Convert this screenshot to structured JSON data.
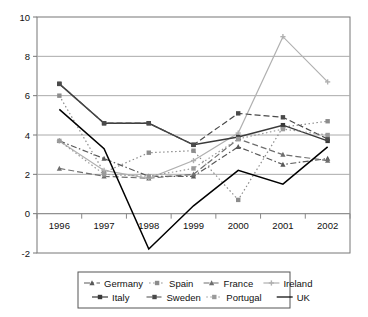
{
  "chart_data": {
    "type": "line",
    "title": "",
    "subtitle": "",
    "xlabel": "",
    "ylabel": "",
    "x": [
      1996,
      1997,
      1998,
      1999,
      2000,
      2001,
      2002
    ],
    "xtick_labels": [
      "1996",
      "1997",
      "1998",
      "1999",
      "2000",
      "2001",
      "2002"
    ],
    "ytick_labels": [
      "10",
      "8",
      "6",
      "4",
      "2",
      "0",
      "-2"
    ],
    "ylim": [
      -2,
      10
    ],
    "ytick_values": [
      10,
      8,
      6,
      4,
      2,
      0,
      -2
    ],
    "grid": "horizontal",
    "legend_position": "bottom",
    "series": [
      {
        "name": "Germany",
        "color": "#585858",
        "line_style": "dashdot",
        "marker": "triangle",
        "values": [
          3.7,
          2.8,
          1.9,
          1.9,
          3.4,
          2.5,
          2.8
        ]
      },
      {
        "name": "Spain",
        "color": "#8c8c8c",
        "line_style": "dotted",
        "marker": "square",
        "values": [
          6.0,
          2.1,
          3.1,
          3.2,
          0.7,
          4.4,
          4.7
        ]
      },
      {
        "name": "France",
        "color": "#6e6e6e",
        "line_style": "dashed",
        "marker": "triangle",
        "values": [
          2.3,
          1.9,
          1.8,
          2.0,
          3.8,
          3.0,
          2.7
        ]
      },
      {
        "name": "Ireland",
        "color": "#b0b0b0",
        "line_style": "solid",
        "marker": "plus",
        "values": [
          3.7,
          2.2,
          1.8,
          2.7,
          4.1,
          9.0,
          6.7
        ]
      },
      {
        "name": "Italy",
        "color": "#3a3a3a",
        "line_style": "solid",
        "marker": "square",
        "values": [
          6.6,
          4.6,
          4.6,
          3.5,
          3.9,
          4.5,
          3.7
        ]
      },
      {
        "name": "Sweden",
        "color": "#4a4a4a",
        "line_style": "dashed",
        "marker": "square",
        "values": [
          6.6,
          4.6,
          4.6,
          3.5,
          5.1,
          4.9,
          3.8
        ]
      },
      {
        "name": "Portugal",
        "color": "#9a9a9a",
        "line_style": "dotted",
        "marker": "square",
        "values": [
          3.7,
          2.0,
          1.9,
          2.3,
          3.8,
          4.3,
          4.0
        ]
      },
      {
        "name": "UK",
        "color": "#000000",
        "line_style": "solid",
        "marker": "none",
        "values": [
          5.3,
          3.3,
          -1.8,
          0.4,
          2.2,
          1.5,
          3.4
        ]
      }
    ]
  },
  "legend": {
    "rows": [
      [
        "Germany",
        "Spain",
        "France",
        "Ireland"
      ],
      [
        "Italy",
        "Sweden",
        "Portugal",
        "UK"
      ]
    ]
  }
}
